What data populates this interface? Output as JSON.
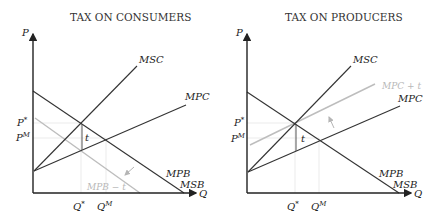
{
  "panels": [
    {
      "title": "TAX ON CONSUMERS",
      "y_axis": "P",
      "x_axis": "Q",
      "curves": {
        "msc": "MSC",
        "mpc": "MPC",
        "mpb": "MPB",
        "msb": "MSB",
        "shifted": "MPB − t"
      },
      "price_labels": {
        "p_star": "P*",
        "p_market": "PM"
      },
      "quantity_labels": {
        "q_star": "Q*",
        "q_market": "QM"
      },
      "tax_label": "t",
      "shift_arrow": "down-left"
    },
    {
      "title": "TAX ON PRODUCERS",
      "y_axis": "P",
      "x_axis": "Q",
      "curves": {
        "msc": "MSC",
        "mpc": "MPC",
        "mpb": "MPB",
        "msb": "MSB",
        "shifted": "MPC + t"
      },
      "price_labels": {
        "p_star": "P*",
        "p_market": "PM"
      },
      "quantity_labels": {
        "q_star": "Q*",
        "q_market": "QM"
      },
      "tax_label": "t",
      "shift_arrow": "up-left"
    }
  ],
  "colors": {
    "curve": "#333333",
    "shifted_curve": "#bdbdbd",
    "guide": "#e6e6e6"
  }
}
